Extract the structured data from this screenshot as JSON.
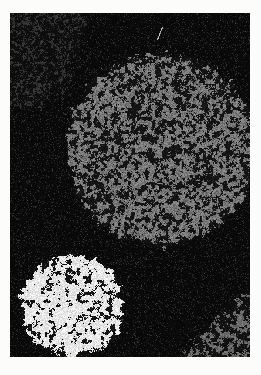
{
  "figure": {
    "page_background": "#fcfcfb",
    "image_background": "#0a0a0a",
    "canvas": {
      "width": 240,
      "height": 344
    },
    "background_noise": {
      "name": "background-speckle",
      "density": 0.1,
      "base_min": 5,
      "base_max": 14,
      "gray_min": 30,
      "gray_max": 52,
      "sparkle_chance": 0.004,
      "sparkle_gray": 70
    },
    "regions": [
      {
        "name": "faint-patch-top-left",
        "type": "ellipse",
        "cx": 0,
        "cy": 0,
        "rx": 75,
        "ry": 100,
        "fuzz": 0.1,
        "ragged": 0.16,
        "density": 0.32,
        "scale": 2.6,
        "seed": 11,
        "gray_min": 38,
        "gray_max": 62,
        "floor": 10
      },
      {
        "name": "large-gray-particle",
        "type": "circle",
        "cx": 151,
        "cy": 136,
        "r": 95,
        "fuzz": 7,
        "ragged": 9,
        "density": 0.53,
        "scale": 3.4,
        "seed": 23,
        "gray_min": 88,
        "gray_max": 150,
        "floor": 16
      },
      {
        "name": "partial-gray-particle-bottom-right",
        "type": "circle",
        "cx": 410,
        "cy": 517,
        "r": 293,
        "fuzz": 9,
        "ragged": 10,
        "density": 0.46,
        "scale": 3.4,
        "seed": 37,
        "gray_min": 80,
        "gray_max": 130,
        "floor": 14
      },
      {
        "name": "bright-white-particle",
        "type": "circle",
        "cx": 62,
        "cy": 292,
        "r": 51,
        "fuzz": 5,
        "ragged": 8,
        "density": 0.7,
        "scale": 4.0,
        "seed": 51,
        "gray_min": 205,
        "gray_max": 255,
        "floor": 16
      },
      {
        "name": "scratch-artifact",
        "type": "line",
        "x1": 152,
        "y1": 14,
        "x2": 147,
        "y2": 26,
        "gray": 180
      }
    ]
  }
}
